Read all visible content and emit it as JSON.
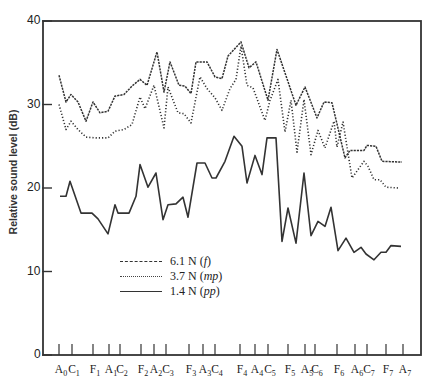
{
  "chart_data": {
    "type": "line",
    "title": "",
    "xlabel": "",
    "ylabel": "Relative sound level (dB)",
    "ylim": [
      0,
      40
    ],
    "yticks": [
      0,
      10,
      20,
      30,
      40
    ],
    "grid": false,
    "legend_position": "inside-lower-left",
    "x_tick_labels": [
      {
        "note": "A",
        "oct": "0",
        "x": 59
      },
      {
        "note": "C",
        "oct": "1",
        "x": 72
      },
      {
        "note": "F",
        "oct": "1",
        "x": 93
      },
      {
        "note": "A",
        "oct": "1",
        "x": 109
      },
      {
        "note": "C",
        "oct": "2",
        "x": 120
      },
      {
        "note": "F",
        "oct": "2",
        "x": 141
      },
      {
        "note": "A",
        "oct": "2",
        "x": 154
      },
      {
        "note": "C",
        "oct": "3",
        "x": 166
      },
      {
        "note": "F",
        "oct": "3",
        "x": 189
      },
      {
        "note": "A",
        "oct": "3",
        "x": 203
      },
      {
        "note": "C",
        "oct": "4",
        "x": 215
      },
      {
        "note": "F",
        "oct": "4",
        "x": 240
      },
      {
        "note": "A",
        "oct": "4",
        "x": 255
      },
      {
        "note": "C",
        "oct": "5",
        "x": 268
      },
      {
        "note": "F",
        "oct": "5",
        "x": 288
      },
      {
        "note": "A",
        "oct": "5",
        "x": 305
      },
      {
        "note": "C",
        "oct": "6",
        "x": 315
      },
      {
        "note": "F",
        "oct": "6",
        "x": 337
      },
      {
        "note": "A",
        "oct": "6",
        "x": 355
      },
      {
        "note": "C",
        "oct": "7",
        "x": 367
      },
      {
        "note": "F",
        "oct": "7",
        "x": 386
      },
      {
        "note": "A",
        "oct": "7",
        "x": 403
      }
    ],
    "series": [
      {
        "name": "6.1 N (f)",
        "label_main": "6.1 N (",
        "label_dyn": "f",
        "style": "dashed",
        "points": [
          [
            59,
            33.5
          ],
          [
            66,
            30.3
          ],
          [
            71,
            31.2
          ],
          [
            78,
            30.3
          ],
          [
            86,
            28.0
          ],
          [
            93,
            30.3
          ],
          [
            100,
            29.0
          ],
          [
            108,
            29.2
          ],
          [
            115,
            31.0
          ],
          [
            124,
            31.2
          ],
          [
            132,
            32.2
          ],
          [
            140,
            33.0
          ],
          [
            147,
            32.3
          ],
          [
            157,
            36.3
          ],
          [
            164,
            31.5
          ],
          [
            170,
            35.1
          ],
          [
            179,
            32.3
          ],
          [
            185,
            32.2
          ],
          [
            191,
            31.3
          ],
          [
            196,
            35.1
          ],
          [
            207,
            35.1
          ],
          [
            215,
            33.3
          ],
          [
            222,
            33.1
          ],
          [
            228,
            35.8
          ],
          [
            241,
            37.5
          ],
          [
            249,
            34.4
          ],
          [
            256,
            35.1
          ],
          [
            268,
            30.5
          ],
          [
            277,
            36.6
          ],
          [
            296,
            29.9
          ],
          [
            305,
            32.1
          ],
          [
            317,
            28.4
          ],
          [
            324,
            30.3
          ],
          [
            332,
            30.2
          ],
          [
            345,
            23.6
          ],
          [
            350,
            24.5
          ],
          [
            364,
            24.5
          ],
          [
            367,
            25.1
          ],
          [
            376,
            25.0
          ],
          [
            382,
            23.2
          ],
          [
            402,
            23.1
          ]
        ]
      },
      {
        "name": "3.7 N (mp)",
        "label_main": "3.7 N (",
        "label_dyn": "mp",
        "style": "dotted",
        "points": [
          [
            59,
            30.0
          ],
          [
            66,
            27.0
          ],
          [
            71,
            28.0
          ],
          [
            78,
            27.0
          ],
          [
            86,
            26.1
          ],
          [
            96,
            26.0
          ],
          [
            108,
            26.0
          ],
          [
            115,
            26.8
          ],
          [
            124,
            27.0
          ],
          [
            132,
            27.6
          ],
          [
            140,
            30.9
          ],
          [
            145,
            29.5
          ],
          [
            154,
            32.3
          ],
          [
            164,
            27.2
          ],
          [
            168,
            32.1
          ],
          [
            178,
            29.0
          ],
          [
            184,
            28.9
          ],
          [
            191,
            27.8
          ],
          [
            200,
            33.3
          ],
          [
            207,
            31.9
          ],
          [
            215,
            30.8
          ],
          [
            222,
            29.3
          ],
          [
            230,
            31.9
          ],
          [
            236,
            33.0
          ],
          [
            241,
            37.0
          ],
          [
            247,
            32.3
          ],
          [
            253,
            32.0
          ],
          [
            265,
            28.1
          ],
          [
            270,
            30.5
          ],
          [
            278,
            33.0
          ],
          [
            285,
            26.7
          ],
          [
            291,
            30.5
          ],
          [
            297,
            24.3
          ],
          [
            304,
            30.6
          ],
          [
            311,
            24.0
          ],
          [
            318,
            26.9
          ],
          [
            325,
            24.8
          ],
          [
            334,
            28.0
          ],
          [
            337,
            24.9
          ],
          [
            343,
            27.9
          ],
          [
            352,
            21.2
          ],
          [
            364,
            23.2
          ],
          [
            368,
            22.6
          ],
          [
            374,
            21.0
          ],
          [
            380,
            21.0
          ],
          [
            386,
            20.1
          ],
          [
            398,
            20.0
          ]
        ]
      },
      {
        "name": "1.4 N (pp)",
        "label_main": "1.4 N (",
        "label_dyn": "pp",
        "style": "solid",
        "points": [
          [
            60,
            19.0
          ],
          [
            66,
            19.0
          ],
          [
            70,
            20.8
          ],
          [
            81,
            17.0
          ],
          [
            92,
            17.0
          ],
          [
            98,
            16.3
          ],
          [
            108,
            14.5
          ],
          [
            115,
            18.0
          ],
          [
            118,
            17.0
          ],
          [
            129,
            17.0
          ],
          [
            136,
            19.0
          ],
          [
            140,
            22.8
          ],
          [
            148,
            20.1
          ],
          [
            156,
            21.8
          ],
          [
            163,
            16.2
          ],
          [
            168,
            18.0
          ],
          [
            176,
            18.1
          ],
          [
            183,
            18.9
          ],
          [
            188,
            16.5
          ],
          [
            197,
            23.0
          ],
          [
            205,
            23.0
          ],
          [
            212,
            21.2
          ],
          [
            216,
            21.2
          ],
          [
            225,
            23.2
          ],
          [
            234,
            26.2
          ],
          [
            242,
            25.0
          ],
          [
            247,
            20.6
          ],
          [
            255,
            23.9
          ],
          [
            262,
            21.6
          ],
          [
            267,
            26.0
          ],
          [
            276,
            26.0
          ],
          [
            282,
            13.6
          ],
          [
            288,
            17.6
          ],
          [
            296,
            13.4
          ],
          [
            304,
            21.8
          ],
          [
            311,
            14.3
          ],
          [
            318,
            16.0
          ],
          [
            325,
            15.4
          ],
          [
            331,
            17.7
          ],
          [
            338,
            12.5
          ],
          [
            346,
            14.0
          ],
          [
            354,
            12.3
          ],
          [
            361,
            12.9
          ],
          [
            366,
            12.1
          ],
          [
            374,
            11.4
          ],
          [
            381,
            12.3
          ],
          [
            386,
            12.3
          ],
          [
            391,
            13.1
          ],
          [
            401,
            13.0
          ]
        ]
      }
    ]
  },
  "axes": {
    "ylabel": "Relative sound level (dB)",
    "ytick_labels": [
      "0",
      "10",
      "20",
      "30",
      "40"
    ]
  },
  "legend": {
    "items": [
      {
        "main": "6.1 N (",
        "dyn": "f",
        "close": ")"
      },
      {
        "main": "3.7 N (",
        "dyn": "mp",
        "close": ")"
      },
      {
        "main": "1.4 N (",
        "dyn": "pp",
        "close": ")"
      }
    ]
  },
  "colors": {
    "line": "#333333",
    "frame": "#333333",
    "background": "#ffffff"
  }
}
